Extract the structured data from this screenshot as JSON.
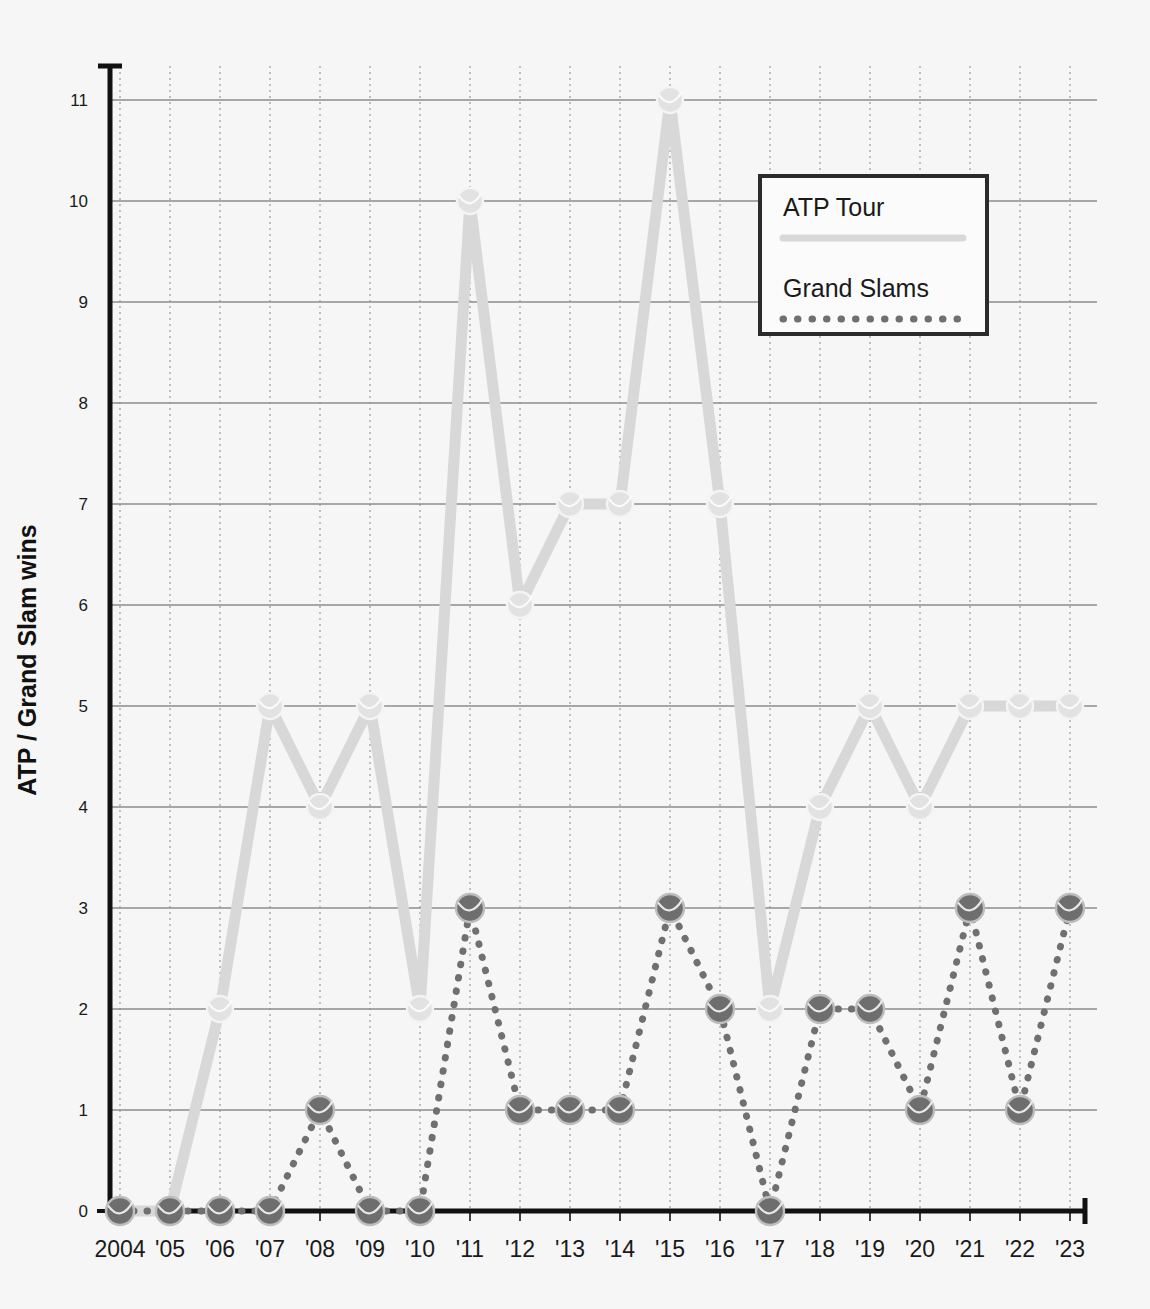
{
  "chart_data": {
    "type": "line",
    "title": "",
    "xlabel": "",
    "ylabel": "ATP / Grand Slam wins",
    "x": [
      2004,
      2005,
      2006,
      2007,
      2008,
      2009,
      2010,
      2011,
      2012,
      2013,
      2014,
      2015,
      2016,
      2017,
      2018,
      2019,
      2020,
      2021,
      2022,
      2023
    ],
    "categories": [
      "2004",
      "'05",
      "'06",
      "'07",
      "'08",
      "'09",
      "'10",
      "'11",
      "'12",
      "'13",
      "'14",
      "'15",
      "'16",
      "'17",
      "'18",
      "'19",
      "'20",
      "'21",
      "'22",
      "'23"
    ],
    "series": [
      {
        "name": "ATP Tour",
        "style": "solid",
        "color": "#d8d8d8",
        "values": [
          0,
          0,
          2,
          5,
          4,
          5,
          2,
          10,
          6,
          7,
          7,
          11,
          7,
          2,
          4,
          5,
          4,
          5,
          5,
          5
        ]
      },
      {
        "name": "Grand Slams",
        "style": "dotted",
        "color": "#707070",
        "values": [
          0,
          0,
          0,
          0,
          1,
          0,
          0,
          3,
          1,
          1,
          1,
          3,
          2,
          0,
          2,
          2,
          1,
          3,
          1,
          3
        ]
      }
    ],
    "ylim": [
      0,
      11
    ],
    "yticks": [
      0,
      1,
      2,
      3,
      4,
      5,
      6,
      7,
      8,
      9,
      10,
      11
    ],
    "ytick_labels": [
      "0",
      "1",
      "2",
      "3",
      "4",
      "5",
      "6",
      "7",
      "8",
      "9",
      "10",
      "11"
    ],
    "grid": {
      "horizontal": true,
      "vertical": true,
      "horizontal_style": "solid",
      "vertical_style": "dotted"
    },
    "legend": {
      "position": "top-right",
      "entries": [
        {
          "label": "ATP Tour",
          "style": "solid",
          "color": "#d8d8d8"
        },
        {
          "label": "Grand Slams",
          "style": "dotted",
          "color": "#707070"
        }
      ]
    },
    "colors": {
      "background": "#f6f6f6",
      "axis": "#111111",
      "gridline": "#8c8c8c",
      "atp_line": "#d8d8d8",
      "atp_marker_fill": "#e2e2e2",
      "atp_marker_edge": "#f4f4f4",
      "slam_line": "#707070",
      "slam_marker_fill": "#6e6e6e",
      "slam_marker_edge": "#bdbdbd",
      "legend_border": "#2b2b2b",
      "legend_background": "#fbfbfb"
    }
  }
}
